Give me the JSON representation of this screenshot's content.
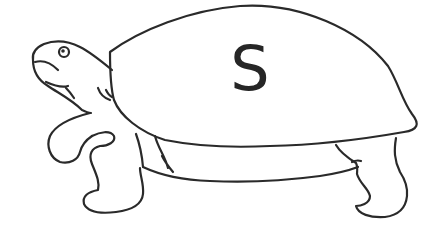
{
  "illustration": {
    "subject": "turtle",
    "style": "black line drawing on white",
    "shell_letter": "S",
    "colors": {
      "line": "#2a2a2a",
      "background": "#ffffff",
      "letter": "#262626"
    }
  }
}
